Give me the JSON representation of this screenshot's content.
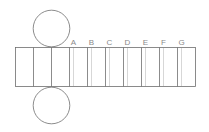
{
  "diagram": {
    "title": "",
    "colors": {
      "stroke": "#6e6e6e",
      "dotted": "#9a9a9a",
      "label": "#8a8a8a"
    },
    "circles": [
      {
        "name": "top-circle",
        "cx": 51.5,
        "cy": 28.5,
        "r": 18.3
      },
      {
        "name": "bottom-circle",
        "cx": 51.5,
        "cy": 105.5,
        "r": 18.3
      }
    ],
    "rectangle": {
      "x": 15.5,
      "y": 47.5,
      "width": 180,
      "height": 39
    },
    "solid_dividers_x": [
      33.5,
      51.5,
      69.5,
      87.5,
      105.5,
      123.5,
      141.5,
      159.5,
      177.5
    ],
    "fold_lines": [
      {
        "label": "A",
        "x": 73.5
      },
      {
        "label": "B",
        "x": 91.5
      },
      {
        "label": "C",
        "x": 109.5
      },
      {
        "label": "D",
        "x": 127.5
      },
      {
        "label": "E",
        "x": 145.5
      },
      {
        "label": "F",
        "x": 163.5
      },
      {
        "label": "G",
        "x": 181.5
      }
    ],
    "label_y": 44.5
  }
}
